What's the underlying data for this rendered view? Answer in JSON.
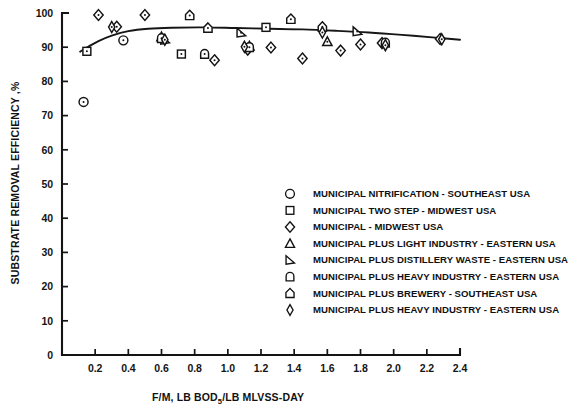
{
  "chart_data": {
    "type": "scatter",
    "title": "",
    "xlabel": "F/M, LB BOD5/LB MLVSS-DAY",
    "xlabel_main": "F/M,  LB BOD",
    "xlabel_sub": "5",
    "xlabel_tail": "/LB MLVSS-DAY",
    "ylabel": "SUBSTRATE REMOVAL EFFICIENCY ,%",
    "xlim": [
      0,
      2.4
    ],
    "ylim": [
      0,
      100
    ],
    "xticks": [
      0.2,
      0.4,
      0.6,
      0.8,
      1.0,
      1.2,
      1.4,
      1.6,
      1.8,
      2.0,
      2.2,
      2.4
    ],
    "xticklabels": [
      "0.2",
      "0.4",
      "0.6",
      "0.8",
      "1.0",
      "1.2",
      "1.4",
      "1.6",
      "1.8",
      "2.0",
      "2.2",
      "2.4"
    ],
    "yticks": [
      0,
      10,
      20,
      30,
      40,
      50,
      60,
      70,
      80,
      90,
      100
    ],
    "yticklabels": [
      "0",
      "10",
      "20",
      "30",
      "40",
      "50",
      "60",
      "70",
      "80",
      "90",
      "100"
    ],
    "grid": false,
    "legend_position": "center-right",
    "fit_curve": {
      "name": "fitted-trend-curve",
      "points": [
        [
          0.11,
          88.7
        ],
        [
          0.16,
          90.2
        ],
        [
          0.22,
          91.8
        ],
        [
          0.3,
          93.4
        ],
        [
          0.4,
          94.7
        ],
        [
          0.52,
          95.4
        ],
        [
          0.66,
          95.7
        ],
        [
          0.85,
          95.8
        ],
        [
          1.05,
          95.6
        ],
        [
          1.25,
          95.4
        ],
        [
          1.45,
          95.2
        ],
        [
          1.65,
          94.8
        ],
        [
          1.85,
          94.3
        ],
        [
          2.05,
          93.6
        ],
        [
          2.25,
          92.8
        ],
        [
          2.4,
          92.2
        ]
      ]
    },
    "series": [
      {
        "name": "MUNICIPAL NITRIFICATION - SOUTHEAST USA",
        "marker": "circle",
        "points": [
          [
            0.13,
            74.0
          ],
          [
            0.37,
            92.0
          ]
        ]
      },
      {
        "name": "MUNICIPAL TWO STEP - MIDWEST USA",
        "marker": "square",
        "points": [
          [
            0.15,
            88.8
          ],
          [
            0.72,
            88.0
          ],
          [
            1.23,
            95.8
          ]
        ]
      },
      {
        "name": "MUNICIPAL - MIDWEST USA",
        "marker": "diamond",
        "points": [
          [
            0.22,
            99.4
          ],
          [
            0.33,
            96.0
          ],
          [
            0.5,
            99.4
          ],
          [
            0.92,
            86.2
          ],
          [
            1.12,
            89.3
          ],
          [
            1.26,
            89.9
          ],
          [
            1.45,
            86.7
          ],
          [
            1.68,
            89.0
          ],
          [
            1.8,
            90.8
          ],
          [
            1.93,
            91.2
          ],
          [
            2.28,
            92.4
          ]
        ]
      },
      {
        "name": "MUNICIPAL PLUS LIGHT INDUSTRY - EASTERN USA",
        "marker": "triangle",
        "points": [
          [
            0.6,
            93.0
          ],
          [
            1.13,
            90.3
          ],
          [
            1.6,
            91.6
          ]
        ]
      },
      {
        "name": "MUNICIPAL PLUS DISTILLERY WASTE - EASTERN USA",
        "marker": "right-triangle",
        "points": [
          [
            0.62,
            92.1
          ],
          [
            1.08,
            94.2
          ],
          [
            1.78,
            94.6
          ]
        ]
      },
      {
        "name": "MUNICIPAL PLUS HEAVY INDUSTRY - EASTERN USA",
        "marker": "round-top-square",
        "points": [
          [
            0.6,
            92.6
          ],
          [
            0.86,
            88.0
          ],
          [
            1.13,
            90.0
          ],
          [
            1.95,
            91.3
          ]
        ]
      },
      {
        "name": "MUNICIPAL PLUS BREWERY - SOUTHEAST USA",
        "marker": "house",
        "points": [
          [
            0.77,
            99.3
          ],
          [
            0.88,
            95.6
          ],
          [
            1.38,
            98.2
          ],
          [
            1.57,
            95.9
          ]
        ]
      },
      {
        "name": "MUNICIPAL PLUS HEAVY INDUSTRY - EASTERN USA",
        "marker": "narrow-diamond",
        "points": [
          [
            0.3,
            95.9
          ],
          [
            0.62,
            92.2
          ],
          [
            1.1,
            90.1
          ],
          [
            1.57,
            94.3
          ],
          [
            1.95,
            90.6
          ],
          [
            2.29,
            92.3
          ]
        ]
      }
    ]
  },
  "legend": {
    "entries": [
      {
        "marker": "circle",
        "label": "MUNICIPAL NITRIFICATION - SOUTHEAST USA"
      },
      {
        "marker": "square",
        "label": "MUNICIPAL TWO STEP - MIDWEST USA"
      },
      {
        "marker": "diamond",
        "label": "MUNICIPAL - MIDWEST USA"
      },
      {
        "marker": "triangle",
        "label": "MUNICIPAL PLUS LIGHT INDUSTRY - EASTERN USA"
      },
      {
        "marker": "right-triangle",
        "label": "MUNICIPAL PLUS DISTILLERY WASTE - EASTERN USA"
      },
      {
        "marker": "round-top-square",
        "label": "MUNICIPAL PLUS HEAVY INDUSTRY - EASTERN USA"
      },
      {
        "marker": "house",
        "label": "MUNICIPAL PLUS BREWERY - SOUTHEAST USA"
      },
      {
        "marker": "narrow-diamond",
        "label": "MUNICIPAL PLUS HEAVY INDUSTRY - EASTERN USA"
      }
    ]
  },
  "colors": {
    "ink": "#131313",
    "background": "#ffffff"
  }
}
